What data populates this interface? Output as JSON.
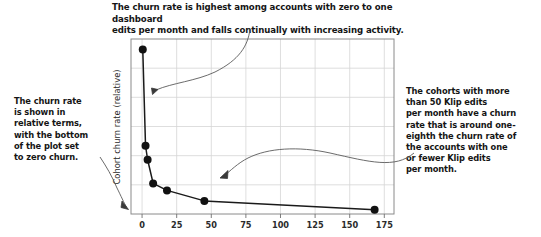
{
  "annotations": {
    "top": "The churn rate is highest among accounts with zero to one dashboard\nedits per month and falls continually with increasing activity.",
    "left": "The churn rate\nis shown in\nrelative terms,\nwith the bottom\nof the plot set\nto zero churn.",
    "right": "The cohorts with more\nthan 50 Klip edits\nper month have a churn\nrate that is around one-\neighth the churn rate of\nthe accounts with one\nor fewer Klip edits\nper month."
  },
  "colors": {
    "line": "#1a1a1a",
    "marker": "#111111",
    "frame": "#8a8a8a",
    "grid": "#d5d5d5",
    "annotation_curve": "#5a5a5a",
    "text": "#151515",
    "background": "#ffffff"
  },
  "chart_data": {
    "type": "line",
    "title": "",
    "xlabel": "",
    "ylabel": "Cohort churn rate (relative)",
    "xlim": [
      -8,
      182
    ],
    "ylim": [
      0,
      1.0
    ],
    "xticks": [
      0,
      25,
      50,
      75,
      100,
      125,
      150,
      175
    ],
    "xtick_labels": [
      "0",
      "25",
      "50",
      "75",
      "100",
      "125",
      "150",
      "175"
    ],
    "yticks": [
      0,
      0.1667,
      0.3333,
      0.5,
      0.6667,
      0.8333,
      1.0
    ],
    "ytick_labels": [
      "",
      "",
      "",
      "",
      "",
      "",
      ""
    ],
    "grid": true,
    "legend": null,
    "series": [
      {
        "name": "Cohort churn rate",
        "x": [
          0.5,
          2.5,
          4.0,
          8.0,
          18.0,
          45.0,
          168.0
        ],
        "y": [
          0.94,
          0.39,
          0.31,
          0.175,
          0.135,
          0.075,
          0.025
        ],
        "marker": "circle",
        "marker_size": 4
      }
    ]
  }
}
